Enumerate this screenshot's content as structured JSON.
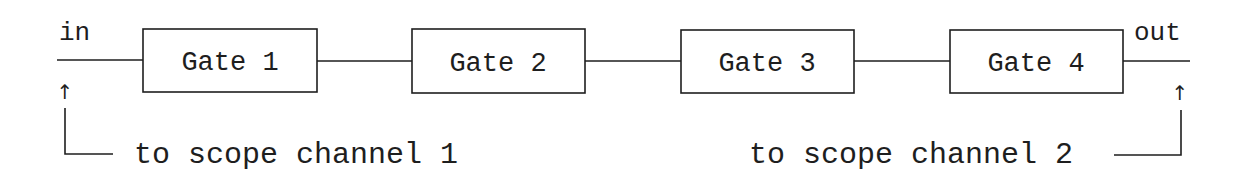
{
  "diagram": {
    "type": "signal-chain",
    "input_label": "in",
    "output_label": "out",
    "gates": [
      {
        "label": "Gate 1"
      },
      {
        "label": "Gate 2"
      },
      {
        "label": "Gate 3"
      },
      {
        "label": "Gate 4"
      }
    ],
    "taps": [
      {
        "label": "to scope channel 1",
        "attached_to": "in"
      },
      {
        "label": "to scope channel 2",
        "attached_to": "out"
      }
    ],
    "arrow_glyph": "↑",
    "colors": {
      "stroke": "#1e1e1e",
      "background": "#ffffff"
    }
  }
}
